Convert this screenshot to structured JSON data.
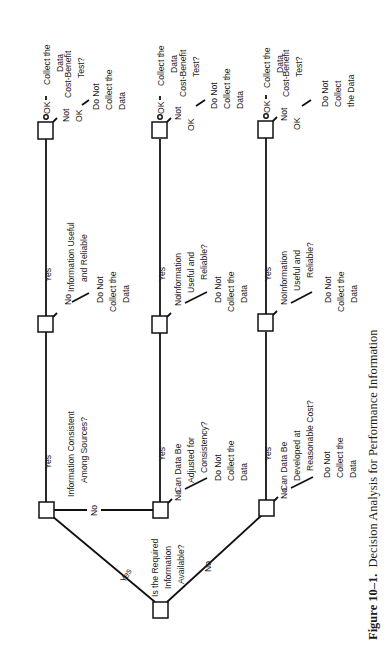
{
  "figure": {
    "caption_number": "Figure 10–1.",
    "caption_text": "Decision Analysis for Performance Information",
    "orientation": "rotated 90 degrees counter-clockwise"
  },
  "root": {
    "question": [
      "Is the Required",
      "Information",
      "Available?"
    ],
    "yes_label": "Yes",
    "no_label": "No"
  },
  "branches": [
    {
      "id": "consistent",
      "question": [
        "Information Consistent",
        "Among Sources?"
      ],
      "yes_label": "Yes",
      "no_label": "No"
    },
    {
      "id": "adjust",
      "question": [
        "Can Data Be",
        "Adjusted for",
        "Consistency?"
      ],
      "yes_label": "Yes",
      "no_label": "No",
      "no_outcome": [
        "Do Not",
        "Collect the",
        "Data"
      ]
    },
    {
      "id": "develop",
      "question": [
        "Can Data Be",
        "Developed at",
        "Reasonable Cost?"
      ],
      "yes_label": "Yes",
      "no_label": "No",
      "no_outcome": [
        "Do Not",
        "Collect the",
        "Data"
      ]
    }
  ],
  "useful_nodes": [
    {
      "question": [
        "Information Useful",
        "and Reliable"
      ],
      "yes_label": "Yes",
      "no_label": "No",
      "no_outcome": [
        "Do Not",
        "Collect the",
        "Data"
      ]
    },
    {
      "question": [
        "Information",
        "Useful and",
        "Reliable?"
      ],
      "yes_label": "Yes",
      "no_label": "No",
      "no_outcome": [
        "Do Not",
        "Collect the",
        "Data"
      ]
    },
    {
      "question": [
        "Information",
        "Useful and",
        "Reliable?"
      ],
      "yes_label": "Yes",
      "no_label": "No",
      "no_outcome": [
        "Do Not",
        "Collect the",
        "Data"
      ]
    }
  ],
  "cost_nodes": [
    {
      "question": [
        "Cost-Benefit",
        "Test?"
      ],
      "ok_label": "OK",
      "ok_outcome": [
        "Collect the",
        "Data"
      ],
      "not_ok_label": [
        "Not",
        "OK"
      ],
      "not_ok_outcome": [
        "Do Not",
        "Collect the",
        "Data"
      ]
    },
    {
      "question": [
        "Cost-Benefit",
        "Test?"
      ],
      "ok_label": "OK",
      "ok_outcome": [
        "Collect the",
        "Data"
      ],
      "not_ok_label": [
        "Not",
        "OK"
      ],
      "not_ok_outcome": [
        "Do Not",
        "Collect the",
        "Data"
      ]
    },
    {
      "question": [
        "Cost-Benefit",
        "Test?"
      ],
      "ok_label": "OK",
      "ok_outcome": [
        "Collect the",
        "Data"
      ],
      "not_ok_label": [
        "Not",
        "OK"
      ],
      "not_ok_outcome": [
        "Do Not",
        "Collect",
        "the Data"
      ]
    }
  ]
}
